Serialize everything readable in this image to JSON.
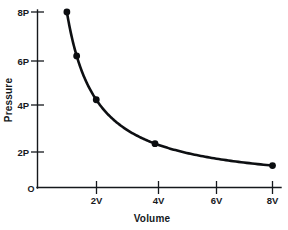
{
  "chart_data": {
    "type": "line",
    "title": "",
    "subtitle": "",
    "xlabel": "Volume",
    "ylabel": "Pressure",
    "grid": false,
    "legend": false,
    "legend_position": "none",
    "xlim": [
      0,
      8.6
    ],
    "ylim": [
      0,
      8.8
    ],
    "relation": "PV = 8PV (constant)",
    "x_tick_labels": [
      "2V",
      "4V",
      "6V",
      "8V"
    ],
    "x_tick_values": [
      2,
      4,
      6,
      8
    ],
    "y_tick_labels": [
      "2P",
      "4P",
      "6P",
      "8P"
    ],
    "y_tick_values": [
      2,
      4,
      6,
      8
    ],
    "origin_label": "O",
    "series": [
      {
        "name": "Pressure vs Volume",
        "color": "#0b0d10",
        "marker": "filled-circle",
        "x": [
          1,
          1.333,
          2,
          4,
          8
        ],
        "y": [
          8,
          6,
          4,
          2,
          1
        ],
        "point_labels": [
          "8P at 1V",
          "6P at 1.33V",
          "4P at 2V",
          "2P at 4V",
          "1P at 8V"
        ]
      }
    ]
  },
  "axes": {
    "y_axis_title": "Pressure",
    "x_axis_title": "Volume",
    "origin": "O"
  }
}
